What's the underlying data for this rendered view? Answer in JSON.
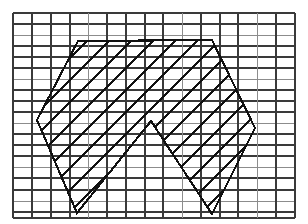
{
  "figure": {
    "background_color": "#ffffff",
    "width": 308,
    "height": 224
  },
  "chart_data": {
    "type": "diagram",
    "xlabel": "",
    "ylabel": "",
    "xlim": [
      0,
      308
    ],
    "ylim": [
      224,
      0
    ],
    "grid": {
      "visible": true,
      "origin_x": 13,
      "origin_y": 13,
      "right": 295,
      "bottom": 218,
      "columns": 15,
      "rows": 18,
      "x_positions": [
        13,
        32,
        51,
        70,
        88,
        107,
        126,
        145,
        163,
        182,
        201,
        220,
        238,
        257,
        276,
        295
      ],
      "y_positions": [
        13,
        24,
        35,
        46,
        57,
        68,
        79,
        90,
        101,
        112,
        123,
        134,
        145,
        156,
        167,
        178,
        190,
        201,
        212,
        218
      ],
      "major_color": "#3a3a3a",
      "minor_color": "#8c8c8c",
      "major_width": 1.6,
      "minor_width": 1.0,
      "minor_row_indices": [
        2,
        6,
        10,
        14,
        17
      ],
      "minor_col_indices": [
        4,
        9,
        13
      ]
    },
    "polygon": {
      "name": "hatched-region",
      "closed": true,
      "stroke_color": "#111111",
      "stroke_width": 2.1,
      "fill": "none",
      "vertices": [
        {
          "label": "W",
          "x": 37,
          "y": 120
        },
        {
          "label": "NW",
          "x": 78,
          "y": 41
        },
        {
          "label": "NE",
          "x": 212,
          "y": 40
        },
        {
          "label": "E",
          "x": 255,
          "y": 128
        },
        {
          "label": "SE",
          "x": 212,
          "y": 214
        },
        {
          "label": "M",
          "x": 151,
          "y": 121
        },
        {
          "label": "SW",
          "x": 77,
          "y": 213
        }
      ]
    },
    "hatching": {
      "angle_degrees": 45,
      "direction": "lower-left to upper-right",
      "spacing": 22,
      "stroke_color": "#111111",
      "stroke_width": 2.0,
      "clipped_to_polygon": true
    }
  }
}
